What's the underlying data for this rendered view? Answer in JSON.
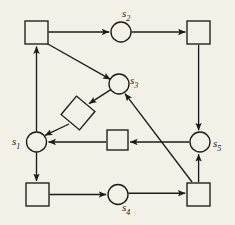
{
  "diagram": {
    "type": "petri-net",
    "background_color": "#f3f0e7",
    "stroke_color": "#1b1b18",
    "fill_color": "#f3f0e7",
    "labels": {
      "s1": {
        "base": "s",
        "sub": "1"
      },
      "s2": {
        "base": "s",
        "sub": "2"
      },
      "s3": {
        "base": "s",
        "sub": "3"
      },
      "s4": {
        "base": "s",
        "sub": "4"
      },
      "s5": {
        "base": "s",
        "sub": "5"
      }
    },
    "places": [
      {
        "id": "s1",
        "label": "s1",
        "cx": 36.5,
        "cy": 142,
        "r": 10
      },
      {
        "id": "s2",
        "label": "s2",
        "cx": 121,
        "cy": 32,
        "r": 10
      },
      {
        "id": "s3",
        "label": "s3",
        "cx": 119,
        "cy": 84,
        "r": 10
      },
      {
        "id": "s4",
        "label": "s4",
        "cx": 118,
        "cy": 194.5,
        "r": 10
      },
      {
        "id": "s5",
        "label": "s5",
        "cx": 200,
        "cy": 142,
        "r": 10
      }
    ],
    "transitions": [
      {
        "id": "t-top-left",
        "x": 25,
        "y": 21,
        "w": 23,
        "h": 23,
        "rotation": 0
      },
      {
        "id": "t-top-right",
        "x": 187,
        "y": 21,
        "w": 23,
        "h": 23,
        "rotation": 0
      },
      {
        "id": "t-diamond",
        "x": 66,
        "y": 101,
        "w": 24,
        "h": 24,
        "rotation": 40
      },
      {
        "id": "t-middle",
        "x": 107,
        "y": 130,
        "w": 21,
        "h": 20,
        "rotation": 0
      },
      {
        "id": "t-bottom-left",
        "x": 26,
        "y": 183,
        "w": 23,
        "h": 23,
        "rotation": 0
      },
      {
        "id": "t-bottom-right",
        "x": 187,
        "y": 183,
        "w": 23,
        "h": 23,
        "rotation": 0
      }
    ],
    "arcs": [
      {
        "id": "arc-topleft-to-s2",
        "from": "t-top-left",
        "to": "s2"
      },
      {
        "id": "arc-s2-to-topright",
        "from": "s2",
        "to": "t-top-right"
      },
      {
        "id": "arc-topleft-to-s3",
        "from": "t-top-left",
        "to": "s3"
      },
      {
        "id": "arc-topright-to-s5",
        "from": "t-top-right",
        "to": "s5"
      },
      {
        "id": "arc-s3-to-diamond",
        "from": "s3",
        "to": "t-diamond"
      },
      {
        "id": "arc-diamond-to-s1",
        "from": "t-diamond",
        "to": "s1"
      },
      {
        "id": "arc-middle-to-s1",
        "from": "t-middle",
        "to": "s1"
      },
      {
        "id": "arc-s5-to-middle",
        "from": "s5",
        "to": "t-middle"
      },
      {
        "id": "arc-s1-to-topleft",
        "from": "s1",
        "to": "t-top-left"
      },
      {
        "id": "arc-s1-to-bottomleft",
        "from": "s1",
        "to": "t-bottom-left"
      },
      {
        "id": "arc-bottomleft-to-s4",
        "from": "t-bottom-left",
        "to": "s4"
      },
      {
        "id": "arc-s4-to-bottomright",
        "from": "s4",
        "to": "t-bottom-right"
      },
      {
        "id": "arc-bottomright-to-s5",
        "from": "t-bottom-right",
        "to": "s5"
      },
      {
        "id": "arc-bottomright-to-s3",
        "from": "t-bottom-right",
        "to": "s3"
      }
    ]
  }
}
